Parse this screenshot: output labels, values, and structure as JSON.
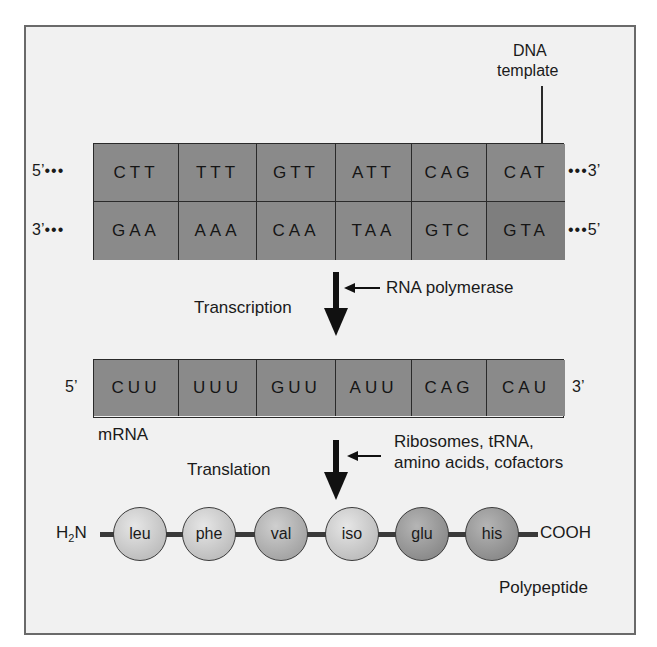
{
  "dna": {
    "label_line1": "DNA",
    "label_line2": "template",
    "top_strand": {
      "left_end": "5’",
      "right_end": "3’",
      "codons": [
        "CTT",
        "TTT",
        "GTT",
        "ATT",
        "CAG",
        "CAT"
      ]
    },
    "bottom_strand": {
      "left_end": "3’",
      "right_end": "5’",
      "codons": [
        "GAA",
        "AAA",
        "CAA",
        "TAA",
        "GTC",
        "GTA"
      ]
    },
    "dots": "•••"
  },
  "transcription": {
    "label": "Transcription",
    "enzyme": "RNA polymerase"
  },
  "mrna": {
    "left_end": "5’",
    "right_end": "3’",
    "label": "mRNA",
    "codons": [
      "CUU",
      "UUU",
      "GUU",
      "AUU",
      "CAG",
      "CAU"
    ]
  },
  "translation": {
    "label": "Translation",
    "factors_line1": "Ribosomes, tRNA,",
    "factors_line2": "amino acids, cofactors"
  },
  "polypeptide": {
    "n_terminus_h": "H",
    "n_terminus_sub": "2",
    "n_terminus_n": "N",
    "c_terminus": "COOH",
    "label": "Polypeptide",
    "amino_acids": [
      "leu",
      "phe",
      "val",
      "iso",
      "glu",
      "his"
    ]
  },
  "colors": {
    "cell_fill": "#8a8a8a",
    "background": "#f1f1f1",
    "frame": "#6a6a6a"
  }
}
